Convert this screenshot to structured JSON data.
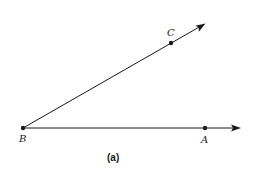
{
  "diagram": {
    "caption": "(a)",
    "points": {
      "B": {
        "label": "B",
        "x": 23,
        "y": 128
      },
      "A": {
        "label": "A",
        "x": 205,
        "y": 128
      },
      "C": {
        "label": "C",
        "x": 171,
        "y": 43
      }
    },
    "rays": [
      {
        "name": "ray-BA",
        "from": "B",
        "through": "A"
      },
      {
        "name": "ray-BC",
        "from": "B",
        "through": "C"
      }
    ],
    "colors": {
      "stroke": "#1a1a1a",
      "background": "#ffffff"
    }
  }
}
